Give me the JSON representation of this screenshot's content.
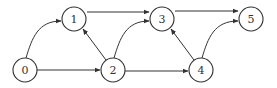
{
  "graph": {
    "type": "directed",
    "nodes": [
      {
        "id": "0",
        "label": "0",
        "x": 25,
        "y": 70
      },
      {
        "id": "1",
        "label": "1",
        "x": 74,
        "y": 19
      },
      {
        "id": "2",
        "label": "2",
        "x": 113,
        "y": 70
      },
      {
        "id": "3",
        "label": "3",
        "x": 162,
        "y": 19
      },
      {
        "id": "4",
        "label": "4",
        "x": 201,
        "y": 70
      },
      {
        "id": "5",
        "label": "5",
        "x": 251,
        "y": 19
      }
    ],
    "edges": [
      {
        "from": "0",
        "to": "1"
      },
      {
        "from": "0",
        "to": "2"
      },
      {
        "from": "1",
        "to": "3"
      },
      {
        "from": "2",
        "to": "1"
      },
      {
        "from": "2",
        "to": "3"
      },
      {
        "from": "2",
        "to": "4"
      },
      {
        "from": "4",
        "to": "3"
      },
      {
        "from": "4",
        "to": "5"
      },
      {
        "from": "3",
        "to": "5"
      }
    ]
  }
}
